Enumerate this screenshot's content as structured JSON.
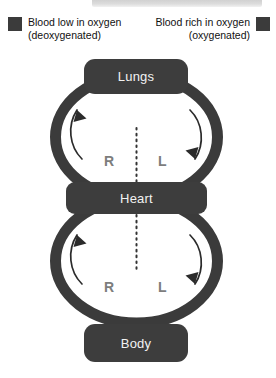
{
  "diagram": {
    "legend": [
      {
        "id": "deoxygenated",
        "line1": "Blood low in oxygen",
        "line2": "(deoxygenated)",
        "swatch_color": "#3b3b3b",
        "swatch_position": "left"
      },
      {
        "id": "oxygenated",
        "line1": "Blood rich in oxygen",
        "line2": "(oxygenated)",
        "swatch_color": "#3b3b3b",
        "swatch_position": "right"
      }
    ],
    "organs": [
      {
        "id": "lungs",
        "label": "Lungs",
        "fill": "#3d3d3d",
        "text_color": "#f2f2f2"
      },
      {
        "id": "heart",
        "label": "Heart",
        "fill": "#3d3d3d",
        "text_color": "#f2f2f2"
      },
      {
        "id": "body",
        "label": "Body",
        "fill": "#3d3d3d",
        "text_color": "#f2f2f2"
      }
    ],
    "side_labels": [
      {
        "id": "r-top",
        "label": "R",
        "loop": "pulmonary",
        "side": "right-of-heart",
        "color": "#7d7d7d"
      },
      {
        "id": "l-top",
        "label": "L",
        "loop": "pulmonary",
        "side": "left-of-heart",
        "color": "#7d7d7d"
      },
      {
        "id": "r-bottom",
        "label": "R",
        "loop": "systemic",
        "side": "right-of-heart",
        "color": "#7d7d7d"
      },
      {
        "id": "l-bottom",
        "label": "L",
        "loop": "systemic",
        "side": "left-of-heart",
        "color": "#7d7d7d"
      }
    ],
    "loops": [
      {
        "id": "pulmonary-loop",
        "connects": [
          "Heart",
          "Lungs"
        ],
        "vessel_color": "#3b3b3b",
        "flow_arrows": [
          {
            "id": "pulmonary-left-arrow",
            "direction": "up",
            "side": "left"
          },
          {
            "id": "pulmonary-right-arrow",
            "direction": "down",
            "side": "right"
          }
        ]
      },
      {
        "id": "systemic-loop",
        "connects": [
          "Heart",
          "Body"
        ],
        "vessel_color": "#3b3b3b",
        "flow_arrows": [
          {
            "id": "systemic-left-arrow",
            "direction": "up",
            "side": "left"
          },
          {
            "id": "systemic-right-arrow",
            "direction": "down",
            "side": "right"
          }
        ]
      }
    ],
    "divider": {
      "id": "midline-divider",
      "style": "dotted",
      "orientation": "vertical",
      "color": "#333333"
    }
  }
}
